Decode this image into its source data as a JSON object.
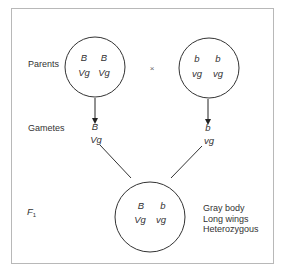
{
  "labels": {
    "parents": "Parents",
    "gametes": "Gametes",
    "f1_letter": "F",
    "f1_sub": "1",
    "cross_symbol": "×"
  },
  "parent_left": {
    "allele_row1": [
      "B",
      "B"
    ],
    "allele_row2": [
      "Vg",
      "Vg"
    ]
  },
  "parent_right": {
    "allele_row1": [
      "b",
      "b"
    ],
    "allele_row2": [
      "vg",
      "vg"
    ]
  },
  "gamete_left": {
    "allele1": "B",
    "allele2": "Vg"
  },
  "gamete_right": {
    "allele1": "b",
    "allele2": "vg"
  },
  "offspring": {
    "allele_row1": [
      "B",
      "b"
    ],
    "allele_row2": [
      "Vg",
      "vg"
    ],
    "phenotype": [
      "Gray body",
      "Long wings",
      "Heterozygous"
    ]
  }
}
